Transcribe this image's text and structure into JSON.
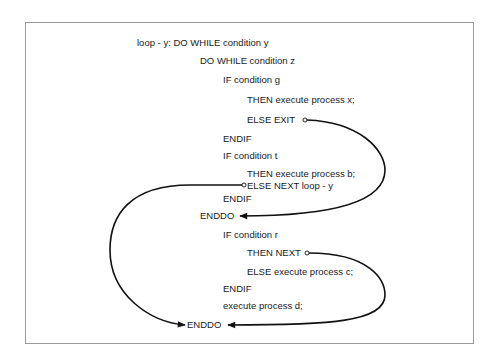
{
  "diagram": {
    "lines": [
      {
        "text": "loop - y: DO WHILE condition y",
        "x": 137,
        "y": 43
      },
      {
        "text": "DO WHILE condition z",
        "x": 200,
        "y": 61
      },
      {
        "text": "IF condition g",
        "x": 223,
        "y": 80
      },
      {
        "text": "THEN execute process x;",
        "x": 247,
        "y": 100
      },
      {
        "text": "ELSE EXIT",
        "x": 247,
        "y": 120
      },
      {
        "text": "ENDIF",
        "x": 223,
        "y": 139
      },
      {
        "text": "IF condition t",
        "x": 223,
        "y": 156
      },
      {
        "text": "THEN execute process b;",
        "x": 247,
        "y": 174
      },
      {
        "text": "ELSE NEXT loop - y",
        "x": 247,
        "y": 185
      },
      {
        "text": "ENDIF",
        "x": 223,
        "y": 198
      },
      {
        "text": "ENDDO",
        "x": 200,
        "y": 216
      },
      {
        "text": "IF condition r",
        "x": 223,
        "y": 235
      },
      {
        "text": "THEN NEXT",
        "x": 247,
        "y": 253
      },
      {
        "text": "ELSE execute process c;",
        "x": 247,
        "y": 272
      },
      {
        "text": "ENDIF",
        "x": 223,
        "y": 288
      },
      {
        "text": "execute process d;",
        "x": 223,
        "y": 305
      },
      {
        "text": "ENDDO",
        "x": 187,
        "y": 325
      }
    ],
    "connectors": [
      {
        "from": "ELSE EXIT",
        "to": "ENDDO (inner)"
      },
      {
        "from": "ELSE NEXT loop - y",
        "to": "ENDDO (outer)"
      },
      {
        "from": "THEN NEXT",
        "to": "ENDDO (outer)"
      }
    ],
    "colors": {
      "line": "#111111",
      "border": "#9a9a9a",
      "text": "#1a1a1a"
    }
  }
}
